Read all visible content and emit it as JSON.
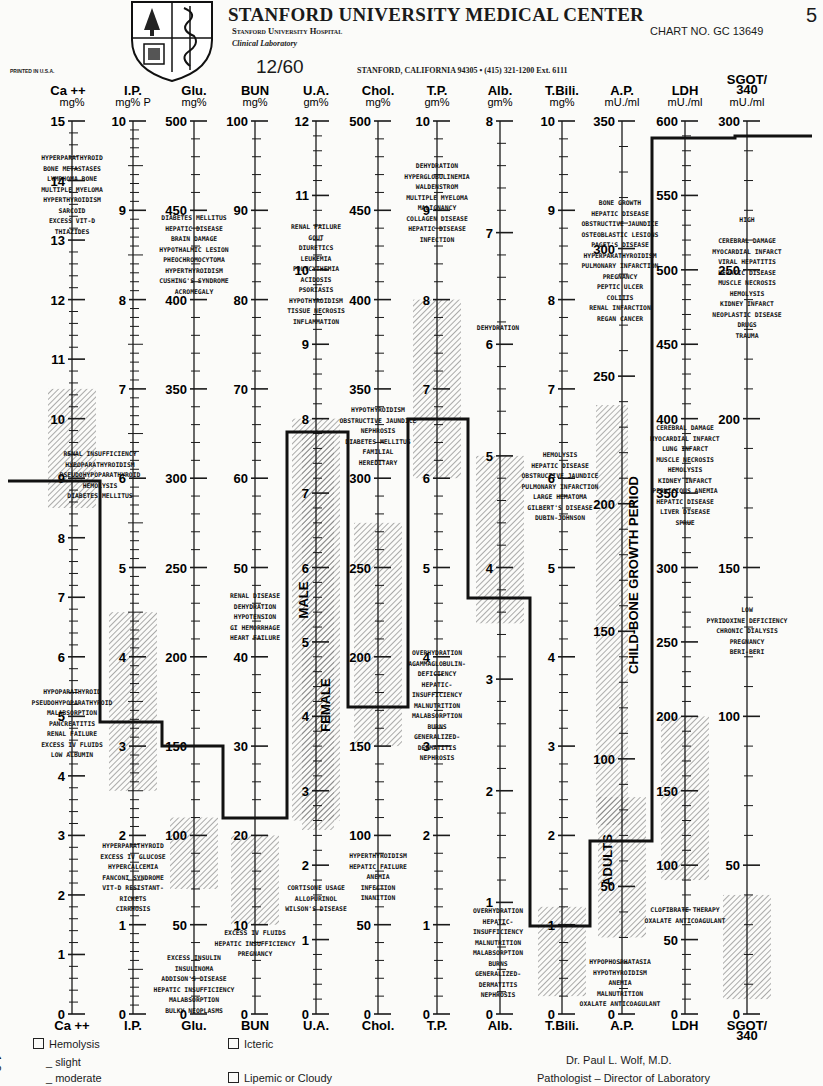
{
  "header": {
    "title": "STANFORD UNIVERSITY MEDICAL CENTER",
    "hospital": "Stanford University Hospital",
    "department": "Clinical Laboratory",
    "chart_no": "CHART NO. GC 13649",
    "page_number": "5",
    "printed": "PRINTED IN U.S.A.",
    "date": "12/60",
    "address": "STANFORD, CALIFORNIA 94305 • (415) 321-1200 Ext. 6111"
  },
  "footer": {
    "hemolysis": "Hemolysis",
    "slight": "_ slight",
    "moderate": "_ moderate",
    "icteric": "Icteric",
    "lipemic": "Lipemic or Cloudy",
    "doctor": "Dr. Paul L. Wolf, M.D.",
    "doctor_title": "Pathologist – Director of Laboratory",
    "side_mark": "1 3"
  },
  "chart_data": {
    "type": "line",
    "subtitle": "Parallel-axis nomogram with normal-range shaded bands and patient profile line",
    "layout": {
      "top_y": 121,
      "bottom_y": 1014,
      "tick_color": "#1a1a1a",
      "band_color": "#555555",
      "profile_color": "#111111"
    },
    "axes": [
      {
        "name": "Ca ++",
        "unit": "mg%",
        "x": 72,
        "max": 15,
        "major": 1,
        "minor": 0.2,
        "labels": [
          0,
          1,
          2,
          3,
          4,
          5,
          6,
          7,
          8,
          9,
          10,
          11,
          12,
          13,
          14,
          15
        ],
        "normal": [
          8.5,
          10.5
        ],
        "patient": 9.0
      },
      {
        "name": "I.P.",
        "unit": "mg% P",
        "x": 133,
        "max": 10,
        "major": 1,
        "minor": 0.1,
        "labels": [
          0,
          1,
          2,
          3,
          4,
          5,
          6,
          7,
          8,
          9,
          10
        ],
        "normal": [
          2.5,
          4.5
        ],
        "patient": 3.3
      },
      {
        "name": "Glu.",
        "unit": "mg%",
        "x": 194,
        "max": 500,
        "major": 50,
        "minor": 10,
        "labels": [
          0,
          50,
          100,
          150,
          200,
          250,
          300,
          350,
          400,
          450,
          500
        ],
        "normal": [
          70,
          110
        ],
        "patient": 150
      },
      {
        "name": "BUN",
        "unit": "mg%",
        "x": 255,
        "max": 100,
        "major": 10,
        "minor": 2,
        "labels": [
          0,
          10,
          20,
          30,
          40,
          50,
          60,
          70,
          80,
          90,
          100
        ],
        "normal": [
          10,
          20
        ],
        "patient": 22
      },
      {
        "name": "U.A.",
        "unit": "gm%",
        "x": 316,
        "max": 12,
        "major": 1,
        "minor": 0.2,
        "labels": [
          0,
          1,
          2,
          3,
          4,
          5,
          6,
          7,
          8,
          9,
          10,
          11,
          12
        ],
        "normal": [
          2.6,
          8.0
        ],
        "patient": 7.8
      },
      {
        "name": "Chol.",
        "unit": "mg%",
        "x": 378,
        "max": 500,
        "major": 50,
        "minor": 10,
        "labels": [
          0,
          50,
          100,
          150,
          200,
          250,
          300,
          350,
          400,
          450,
          500
        ],
        "normal": [
          150,
          275
        ],
        "patient": 165
      },
      {
        "name": "T.P.",
        "unit": "gm%",
        "x": 437,
        "max": 10,
        "major": 1,
        "minor": 0.2,
        "labels": [
          0,
          1,
          2,
          3,
          4,
          5,
          6,
          7,
          8,
          9,
          10
        ],
        "normal": [
          6.0,
          8.0
        ],
        "patient": 8.1
      },
      {
        "name": "Alb.",
        "unit": "gm%",
        "x": 500,
        "max": 8,
        "major": 1,
        "minor": 0.2,
        "labels": [
          0,
          1,
          2,
          3,
          4,
          5,
          6,
          7,
          8
        ],
        "normal": [
          3.5,
          5.0
        ],
        "patient": 4.4
      },
      {
        "name": "T.Bili.",
        "unit": "mg%",
        "x": 562,
        "max": 10,
        "major": 1,
        "minor": 0.2,
        "labels": [
          0,
          1,
          2,
          3,
          4,
          5,
          6,
          7,
          8,
          9,
          10
        ],
        "normal": [
          0.2,
          1.2
        ],
        "patient": 1.0
      },
      {
        "name": "A.P.",
        "unit": "mU./ml",
        "x": 622,
        "max": 350,
        "major": 50,
        "minor": 10,
        "labels": [
          0,
          50,
          100,
          150,
          200,
          250,
          300,
          350
        ],
        "normal": [
          30,
          85
        ],
        "patient": 70
      },
      {
        "name": "LDH",
        "unit": "mU./ml",
        "x": 685,
        "max": 600,
        "major": 50,
        "minor": 10,
        "labels": [
          0,
          50,
          100,
          150,
          200,
          250,
          300,
          350,
          400,
          450,
          500,
          550,
          600
        ],
        "normal": [
          90,
          200
        ],
        "patient": 590
      },
      {
        "name": "SGOT/340",
        "unit": "mU./ml",
        "x": 747,
        "max": 300,
        "major": 50,
        "minor": 10,
        "labels": [
          0,
          50,
          100,
          150,
          200,
          250,
          300
        ],
        "normal": [
          5,
          40
        ],
        "patient": 295
      }
    ],
    "band_labels": [
      {
        "text": "MALE",
        "x": 308,
        "y": 600,
        "rotate": -90
      },
      {
        "text": "FEMALE",
        "x": 330,
        "y": 705,
        "rotate": -90
      },
      {
        "text": "CHILD-BONE GROWTH PERIOD",
        "x": 638,
        "y": 575,
        "rotate": -90
      },
      {
        "text": "ADULTS",
        "x": 612,
        "y": 860,
        "rotate": -90
      }
    ],
    "extra_bands": [
      {
        "x": 612,
        "y1": 405,
        "y2": 825
      },
      {
        "x": 318,
        "y1": 430,
        "y2": 830
      }
    ],
    "annotations": [
      {
        "x": 72,
        "y": 160,
        "lines": [
          "HYPERPARATHYROID",
          "BONE METASTASES",
          "LYMPHOMA BONE",
          "MULTIPLE MYELOMA",
          "HYPERTHYROIDISM",
          "SARCOID",
          "EXCESS VIT-D",
          "THIAZIDES"
        ]
      },
      {
        "x": 100,
        "y": 456,
        "lines": [
          "RENAL INSUFFICIENCY",
          "HYPOPARATHYROIDISM",
          "PSEUDOHYPOPARATHYROID",
          "HEMOLYSIS",
          "DIABETES MELLITUS"
        ]
      },
      {
        "x": 72,
        "y": 694,
        "lines": [
          "HYPOPARATHYROID",
          "PSEUDOHYPOPARATHYROID",
          "MALABSORPTION",
          "PANCREATITIS",
          "RENAL FAILURE",
          "EXCESS IV FLUIDS",
          "LOW ALBUMIN"
        ]
      },
      {
        "x": 133,
        "y": 848,
        "lines": [
          "HYPERPARATHYROID",
          "EXCESS IV GLUCOSE",
          "HYPERCALCEMIA",
          "FANCONI SYNDROME",
          "VIT-D RESISTANT-",
          "RICKETS",
          "CIRRHOSIS"
        ]
      },
      {
        "x": 194,
        "y": 220,
        "lines": [
          "DIABETES MELLITUS",
          "HEPATIC DISEASE",
          "BRAIN DAMAGE",
          "HYPOTHALMIC LESION",
          "PHEOCHROMOCYTOMA",
          "HYPERTHYROIDISM",
          "CUSHING'S SYNDROME",
          "ACROMEGALY"
        ]
      },
      {
        "x": 194,
        "y": 960,
        "lines": [
          "EXCESS INSULIN",
          "INSULINOMA",
          "ADDISON'S DISEASE",
          "HEPATIC INSUFFICIENCY",
          "MALABSORPTION",
          "BULKY NEOPLASMS"
        ]
      },
      {
        "x": 255,
        "y": 598,
        "lines": [
          "RENAL DISEASE",
          "DEHYDRATION",
          "HYPOTENSION",
          "GI HEMORRHAGE",
          "HEART FAILURE"
        ]
      },
      {
        "x": 255,
        "y": 935,
        "lines": [
          "EXCESS IV FLUIDS",
          "HEPATIC INSUFFICIENCY",
          "PREGNANCY"
        ]
      },
      {
        "x": 316,
        "y": 229,
        "lines": [
          "RENAL FAILURE",
          "GOUT",
          "DIURETICS",
          "LEUKEMIA",
          "POLYCYTHEMIA",
          "ACIDOSIS",
          "PSORIASIS",
          "HYPOTHYROIDISM",
          "TISSUE NECROSIS",
          "INFLAMMATION"
        ]
      },
      {
        "x": 316,
        "y": 890,
        "lines": [
          "CORTISONE USAGE",
          "ALLOPURINOL",
          "WILSON'S DISEASE"
        ]
      },
      {
        "x": 378,
        "y": 412,
        "lines": [
          "HYPOTHYROIDISM",
          "OBSTRUCTIVE JAUNDICE",
          "NEPHROSIS",
          "DIABETES MELLITUS",
          "FAMILIAL",
          "HEREDITARY"
        ]
      },
      {
        "x": 378,
        "y": 858,
        "lines": [
          "HYPERTHYROIDISM",
          "HEPATIC FAILURE",
          "ANEMIA",
          "INFECTION",
          "INANITION"
        ]
      },
      {
        "x": 437,
        "y": 168,
        "lines": [
          "DEHYDRATION",
          "HYPERGLOBULINEMIA",
          "WALDENSTROM",
          "MULTIPLE MYELOMA",
          "MALIGNANCY",
          "COLLAGEN DISEASE",
          "HEPATIC DISEASE",
          "INFECTION"
        ]
      },
      {
        "x": 437,
        "y": 655,
        "lines": [
          "OVERHYDRATION",
          "AGAMMAGLOBULIN-",
          "DEFICIENCY",
          "HEPATIC-",
          "INSUFFICIENCY",
          "MALNUTRITION",
          "MALABSORPTION",
          "BURNS",
          "GENERALIZED-",
          "DERMATITIS",
          "NEPHROSIS"
        ]
      },
      {
        "x": 498,
        "y": 330,
        "lines": [
          "DEHYDRATION"
        ]
      },
      {
        "x": 498,
        "y": 913,
        "lines": [
          "OVERHYDRATION",
          "HEPATIC-",
          "INSUFFICIENCY",
          "MALNUTRITION",
          "MALABSORPTION",
          "BURNS",
          "GENERALIZED-",
          "DERMATITIS",
          "NEPHROSIS"
        ]
      },
      {
        "x": 560,
        "y": 457,
        "lines": [
          "HEMOLYSIS",
          "HEPATIC DISEASE",
          "OBSTRUCTIVE JAUNDICE",
          "PULMONARY INFARCTION",
          "LARGE HEMATOMA",
          "GILBERT'S DISEASE",
          "DUBIN-JOHNSON"
        ]
      },
      {
        "x": 620,
        "y": 205,
        "lines": [
          "BONE GROWTH",
          "HEPATIC DISEASE",
          "OBSTRUCTIVE JAUNDICE",
          "OSTEOBLASTIC LESIONS",
          "PAGET'S DISEASE",
          "HYPERPARATHYROIDISM",
          "PULMONARY INFARCTION",
          "PREGNANCY",
          "PEPTIC ULCER",
          "COLITIS",
          "RENAL INFARCTION",
          "REGAN CANCER"
        ]
      },
      {
        "x": 620,
        "y": 964,
        "lines": [
          "HYPOPHOSPHATASIA",
          "HYPOTHYROIDISM",
          "ANEMIA",
          "MALNUTRITION",
          "OXALATE ANTICOAGULANT"
        ]
      },
      {
        "x": 685,
        "y": 430,
        "lines": [
          "CEREBRAL DAMAGE",
          "MYOCARDIAL INFARCT",
          "LUNG INFARCT",
          "MUSCLE NECROSIS",
          "HEMOLYSIS",
          "KIDNEY INFARCT",
          "PERNICIOUS ANEMIA",
          "HEPATIC DISEASE",
          "LIVER DISEASE",
          "SPRUE"
        ]
      },
      {
        "x": 685,
        "y": 912,
        "lines": [
          "CLOFIBRATE THERAPY",
          "OXALATE ANTICOAGULANT"
        ]
      },
      {
        "x": 747,
        "y": 222,
        "lines": [
          "HIGH",
          "",
          "CEREBRAL DAMAGE",
          "MYOCARDIAL INFARCT",
          "VIRAL HEPATITIS",
          "HEPATIC DISEASE",
          "MUSCLE NECROSIS",
          "HEMOLYSIS",
          "KIDNEY INFARCT",
          "NEOPLASTIC DISEASE",
          "DRUGS",
          "TRAUMA"
        ]
      },
      {
        "x": 747,
        "y": 612,
        "lines": [
          "LOW",
          "PYRIDOXINE DEFICIENCY",
          "CHRONIC DIALYSIS",
          "PREGNANCY",
          "BERI-BERI"
        ]
      }
    ],
    "profile_line": {
      "start_x": 8,
      "end_x": 812,
      "points": [
        [
          8,
          481
        ],
        [
          100,
          481
        ],
        [
          100,
          722
        ],
        [
          162,
          722
        ],
        [
          162,
          746
        ],
        [
          223,
          746
        ],
        [
          223,
          818
        ],
        [
          287,
          818
        ],
        [
          287,
          432
        ],
        [
          348,
          432
        ],
        [
          348,
          707
        ],
        [
          408,
          707
        ],
        [
          408,
          419
        ],
        [
          468,
          419
        ],
        [
          468,
          598
        ],
        [
          530,
          598
        ],
        [
          530,
          926
        ],
        [
          590,
          926
        ],
        [
          590,
          841
        ],
        [
          652,
          841
        ],
        [
          652,
          138
        ],
        [
          735,
          138
        ],
        [
          735,
          136
        ],
        [
          812,
          136
        ]
      ]
    }
  }
}
